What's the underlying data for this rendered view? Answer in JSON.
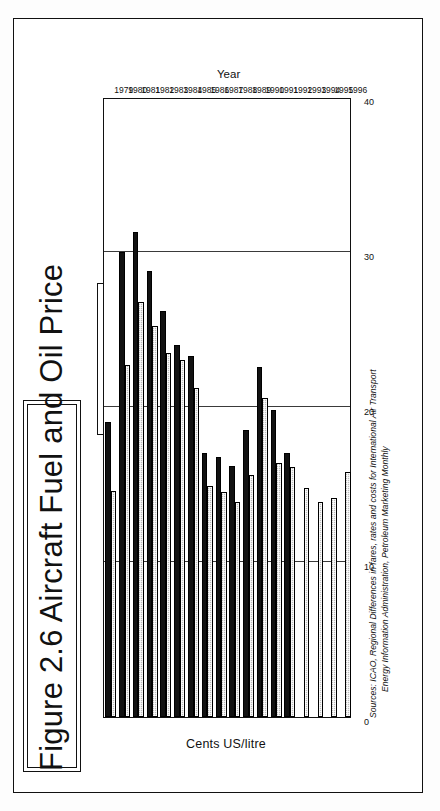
{
  "figure": {
    "title": "Figure 2.6   Aircraft Fuel and Oil Price",
    "legend": {
      "items": [
        {
          "label": "International fuel price",
          "swatch": "black-solid",
          "color": "#121212"
        },
        {
          "label": "US Jet fuel price",
          "swatch": "grey-hatched",
          "color": "#bdbdbd"
        }
      ]
    },
    "sources": {
      "prefix": "Sources:",
      "line1": "ICAO, Regional Differences in fares, rates and costs for International Air Transport",
      "line2": "Energy Information Administration, Petroleum Marketing Monthly"
    }
  },
  "chart_data": {
    "type": "bar",
    "orientation": "horizontal-rotated",
    "title": "Figure 2.6   Aircraft Fuel and Oil Price",
    "xlabel": "Year",
    "ylabel": "Cents US/litre",
    "ylim": [
      0,
      40
    ],
    "yticks": [
      0,
      10,
      20,
      30,
      40
    ],
    "ytick_labels": [
      "0",
      "10",
      "20",
      "30",
      "40"
    ],
    "grid": true,
    "legend_position": "top-right-outside",
    "categories": [
      "1979",
      "1980",
      "1981",
      "1982",
      "1983",
      "1984",
      "1985",
      "1986",
      "1987",
      "1988",
      "1989",
      "1990",
      "1991",
      "1992",
      "1993",
      "1994",
      "1995",
      "1996"
    ],
    "series": [
      {
        "name": "International fuel price",
        "color": "#121212",
        "values": [
          19.0,
          30.0,
          31.3,
          28.8,
          26.2,
          24.0,
          23.3,
          17.0,
          16.8,
          16.2,
          18.5,
          22.6,
          19.8,
          17.0,
          null,
          null,
          null,
          null
        ]
      },
      {
        "name": "US Jet fuel price",
        "color": "#bdbdbd",
        "values": [
          14.6,
          22.7,
          26.8,
          25.2,
          23.5,
          23.0,
          21.2,
          14.9,
          14.5,
          13.9,
          15.6,
          20.6,
          16.4,
          16.1,
          14.8,
          13.9,
          14.1,
          15.8
        ]
      }
    ]
  }
}
